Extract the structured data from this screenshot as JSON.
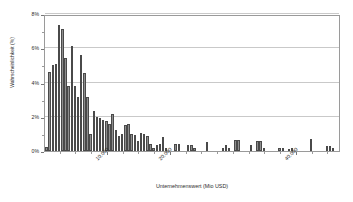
{
  "chart_data": {
    "type": "bar",
    "title": "",
    "subtitle": "",
    "xlabel": "Unternehmenswert (Mio USD)",
    "ylabel": "Wahrscheinlichkeit (%)",
    "xlim": [
      0,
      47000
    ],
    "ylim": [
      0,
      8
    ],
    "grid": true,
    "legend": null,
    "y_ticks": [
      "0%",
      "2%",
      "4%",
      "6%",
      "8%"
    ],
    "y_tick_values": [
      0,
      2,
      4,
      6,
      8
    ],
    "x_ticks": [
      "10.000",
      "20.000",
      "40.000"
    ],
    "x_tick_values": [
      10000,
      20000,
      40000
    ],
    "bin_width": 500,
    "x_start": 250,
    "series": [
      {
        "name": "Wahrscheinlichkeit",
        "color": "#8e8e8e",
        "categories": [
          250,
          750,
          1250,
          1750,
          2250,
          2750,
          3250,
          3750,
          4250,
          4750,
          5250,
          5750,
          6250,
          6750,
          7250,
          7750,
          8250,
          8750,
          9250,
          9750,
          10250,
          10750,
          11250,
          11750,
          12250,
          12750,
          13250,
          13750,
          14250,
          14750,
          15250,
          15750,
          16250,
          16750,
          17250,
          17750,
          18250,
          18750,
          19250,
          19750,
          20250,
          20750,
          21250,
          21750,
          22250,
          22750,
          23250,
          23750,
          24250,
          24750,
          25250,
          25750,
          26250,
          26750,
          27250,
          27750,
          28250,
          28750,
          29250,
          29750,
          30250,
          30750,
          31250,
          31750,
          32250,
          32750,
          33250,
          33750,
          34250,
          34750,
          35250,
          35750,
          36250,
          36750,
          37250,
          37750,
          38250,
          38750,
          39250,
          39750,
          40250,
          40750,
          41250,
          41750,
          42250,
          42750,
          43250,
          43750,
          44250,
          44750,
          45250,
          45750,
          46250
        ],
        "values": [
          0.25,
          4.6,
          5.0,
          5.1,
          7.35,
          7.15,
          5.45,
          3.8,
          6.15,
          3.8,
          3.15,
          5.6,
          4.55,
          3.15,
          1.0,
          2.35,
          2.0,
          1.95,
          1.8,
          1.75,
          1.6,
          2.15,
          1.25,
          0.85,
          1.0,
          1.5,
          1.6,
          1.0,
          0.95,
          0.6,
          1.05,
          1.0,
          0.85,
          0.4,
          0.15,
          0.35,
          0.4,
          0.8,
          0.15,
          0.0,
          0.0,
          0.4,
          0.4,
          0.0,
          0.0,
          0.35,
          0.35,
          0.15,
          0.0,
          0.0,
          0.0,
          0.55,
          0.0,
          0.0,
          0.0,
          0.0,
          0.2,
          0.35,
          0.15,
          0.0,
          0.65,
          0.65,
          0.0,
          0.0,
          0.0,
          0.35,
          0.0,
          0.6,
          0.6,
          0.15,
          0.0,
          0.0,
          0.0,
          0.0,
          0.15,
          0.15,
          0.0,
          0.1,
          0.15,
          0.0,
          0.0,
          0.0,
          0.0,
          0.0,
          0.7,
          0.0,
          0.0,
          0.0,
          0.0,
          0.3,
          0.3,
          0.15,
          0.0
        ]
      }
    ]
  }
}
